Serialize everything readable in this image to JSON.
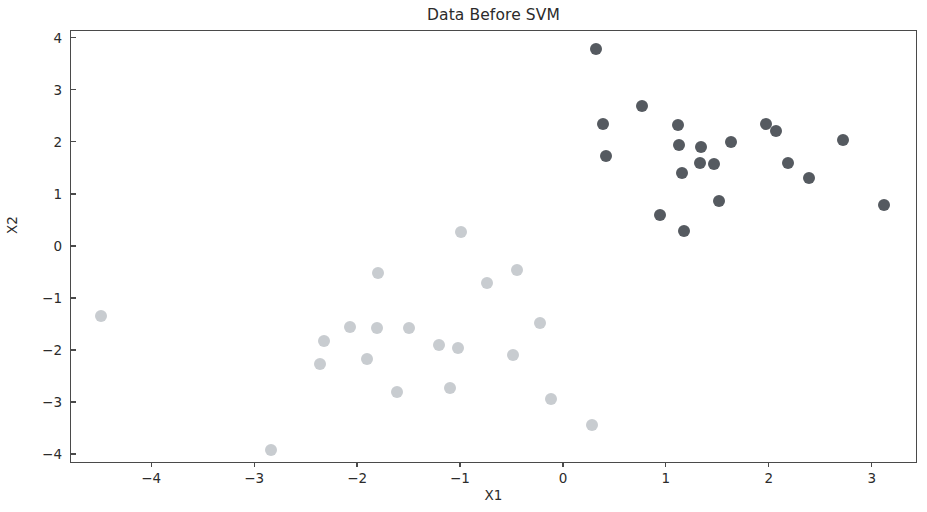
{
  "chart_data": {
    "type": "scatter",
    "title": "Data Before SVM",
    "xlabel": "X1",
    "ylabel": "X2",
    "xlim": [
      -4.78,
      3.45
    ],
    "ylim": [
      -4.19,
      4.13
    ],
    "xticks": [
      -4,
      -3,
      -2,
      -1,
      0,
      1,
      2,
      3
    ],
    "yticks": [
      -4,
      -3,
      -2,
      -1,
      0,
      1,
      2,
      3,
      4
    ],
    "xticklabels": [
      "−4",
      "−3",
      "−2",
      "−1",
      "0",
      "1",
      "2",
      "3"
    ],
    "yticklabels": [
      "−4",
      "−3",
      "−2",
      "−1",
      "0",
      "1",
      "2",
      "3",
      "4"
    ],
    "grid": false,
    "legend": null,
    "marker": "circle",
    "marker_size": 12,
    "series": [
      {
        "name": "class-0",
        "color": "#c8ccd0",
        "points": [
          [
            -4.49,
            -1.35
          ],
          [
            -2.84,
            -3.93
          ],
          [
            -2.36,
            -2.27
          ],
          [
            -2.32,
            -1.82
          ],
          [
            -2.07,
            -1.56
          ],
          [
            -1.9,
            -2.17
          ],
          [
            -1.81,
            -1.58
          ],
          [
            -1.8,
            -0.52
          ],
          [
            -1.61,
            -2.81
          ],
          [
            -1.5,
            -1.57
          ],
          [
            -1.2,
            -1.9
          ],
          [
            -1.1,
            -2.72
          ],
          [
            -1.02,
            -1.96
          ],
          [
            -0.99,
            0.26
          ],
          [
            -0.74,
            -0.71
          ],
          [
            -0.45,
            -0.46
          ],
          [
            -0.22,
            -1.48
          ],
          [
            -0.49,
            -2.1
          ],
          [
            -0.12,
            -2.95
          ],
          [
            0.28,
            -3.45
          ]
        ]
      },
      {
        "name": "class-1",
        "color": "#555a60",
        "points": [
          [
            0.32,
            3.79
          ],
          [
            0.39,
            2.35
          ],
          [
            0.42,
            1.73
          ],
          [
            0.77,
            2.68
          ],
          [
            0.94,
            0.6
          ],
          [
            1.12,
            2.33
          ],
          [
            1.13,
            1.94
          ],
          [
            1.16,
            1.4
          ],
          [
            1.18,
            0.28
          ],
          [
            1.33,
            1.6
          ],
          [
            1.34,
            1.9
          ],
          [
            1.47,
            1.57
          ],
          [
            1.52,
            0.86
          ],
          [
            1.63,
            2.0
          ],
          [
            1.97,
            2.35
          ],
          [
            2.07,
            2.21
          ],
          [
            2.19,
            1.59
          ],
          [
            2.39,
            1.3
          ],
          [
            2.72,
            2.04
          ],
          [
            3.12,
            0.79
          ]
        ]
      }
    ]
  }
}
